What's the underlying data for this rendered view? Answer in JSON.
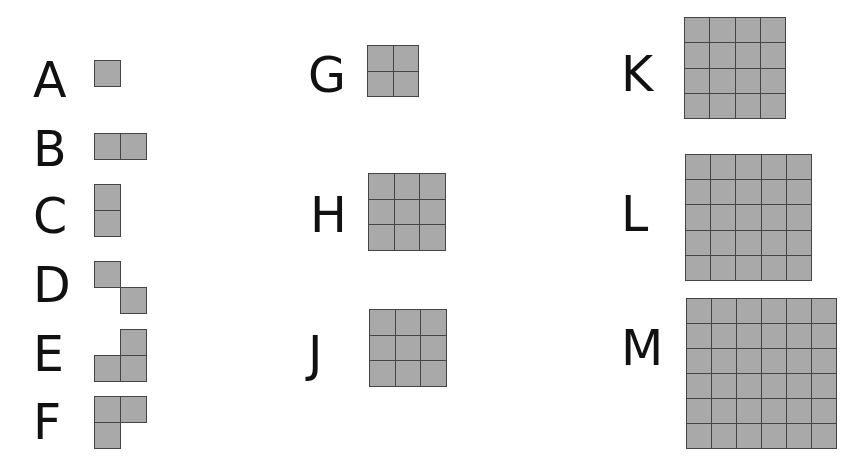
{
  "figure": {
    "cell_fill": "#a9a9a9",
    "cell_border": "#454545",
    "label_color": "#111111",
    "items": [
      {
        "label": "A",
        "lx": 33,
        "ly": 56,
        "x": 94,
        "y": 60,
        "cell": 26,
        "cells": [
          [
            0,
            0
          ]
        ]
      },
      {
        "label": "B",
        "lx": 33,
        "ly": 125,
        "x": 94,
        "y": 133,
        "cell": 26,
        "cells": [
          [
            0,
            0
          ],
          [
            1,
            0
          ]
        ]
      },
      {
        "label": "C",
        "lx": 33,
        "ly": 192,
        "x": 94,
        "y": 184,
        "cell": 26,
        "cells": [
          [
            0,
            0
          ],
          [
            0,
            1
          ]
        ]
      },
      {
        "label": "D",
        "lx": 33,
        "ly": 261,
        "x": 94,
        "y": 261,
        "cell": 26,
        "cells": [
          [
            0,
            0
          ],
          [
            1,
            1
          ]
        ]
      },
      {
        "label": "E",
        "lx": 33,
        "ly": 330,
        "x": 94,
        "y": 329,
        "cell": 26,
        "cells": [
          [
            1,
            0
          ],
          [
            0,
            1
          ],
          [
            1,
            1
          ]
        ]
      },
      {
        "label": "F",
        "lx": 33,
        "ly": 398,
        "x": 94,
        "y": 396,
        "cell": 26,
        "cells": [
          [
            0,
            0
          ],
          [
            1,
            0
          ],
          [
            0,
            1
          ]
        ]
      },
      {
        "label": "G",
        "lx": 308,
        "ly": 51,
        "x": 367,
        "y": 45,
        "cell": 25.5,
        "grid": 2
      },
      {
        "label": "H",
        "lx": 310,
        "ly": 191,
        "x": 368,
        "y": 173,
        "cell": 25.5,
        "grid": 3
      },
      {
        "label": "J",
        "lx": 308,
        "ly": 330,
        "x": 369,
        "y": 309,
        "cell": 25.5,
        "grid": 3
      },
      {
        "label": "K",
        "lx": 621,
        "ly": 50,
        "x": 684,
        "y": 17,
        "cell": 25.3,
        "grid": 4
      },
      {
        "label": "L",
        "lx": 621,
        "ly": 190,
        "x": 685,
        "y": 154,
        "cell": 25.2,
        "grid": 5
      },
      {
        "label": "M",
        "lx": 621,
        "ly": 324,
        "x": 686,
        "y": 298,
        "cell": 25.0,
        "grid": 6
      }
    ]
  }
}
